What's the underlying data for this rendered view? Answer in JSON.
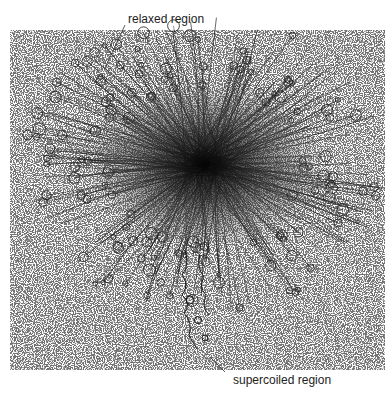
{
  "figure": {
    "labels": {
      "relaxed": "relaxed region",
      "supercoiled": "supercoiled region"
    },
    "colors": {
      "background": "#ffffff",
      "speckle": "#555555",
      "dna_strands": "#1a1a1a",
      "label_text": "#222222"
    }
  }
}
